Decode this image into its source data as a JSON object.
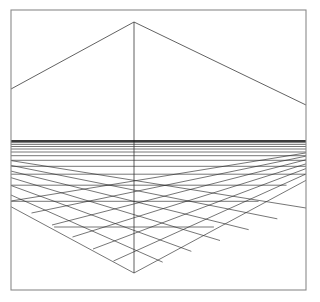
{
  "figure": {
    "canvas": {
      "width": 320,
      "height": 302,
      "background_color": "#ffffff"
    }
  },
  "frame": {
    "name": "outer-border",
    "x": 11,
    "y": 10,
    "width": 295,
    "height": 280,
    "stroke_color": "#8a8a8a",
    "stroke_width": 1.1
  },
  "geometry": {
    "apex": {
      "x": 134,
      "y": 22
    },
    "bottom_vertex": {
      "x": 134,
      "y": 273
    },
    "horizon_y": 141,
    "center_axis_x": 134,
    "left_edge_x": 11,
    "right_edge_x": 306,
    "bottom_edge_y": 290,
    "roof_left_end": {
      "x": 11,
      "y": 89
    },
    "roof_right_end": {
      "x": 306,
      "y": 105
    },
    "stroke_color": "#2b2b2b"
  },
  "chart_data": {
    "type": "line",
    "xlabel": "",
    "ylabel": "",
    "grid": true,
    "legend_position": "none",
    "xlim": [
      11,
      306
    ],
    "ylim": [
      10,
      290
    ],
    "horizon_rows_y": [
      141.0,
      142.6,
      144.4,
      146.5,
      149.0,
      152.0,
      155.7,
      160.3,
      166.3,
      174.2,
      185.2,
      201.3,
      227.0,
      273.0
    ],
    "floor_depth_rows": 13,
    "floor_columns_left": 6,
    "floor_columns_right": 6,
    "series": [
      {
        "name": "roof-diagonals",
        "points": [
          [
            11,
            89
          ],
          [
            134,
            22
          ],
          [
            306,
            105
          ]
        ]
      },
      {
        "name": "center-vertical-axis",
        "points": [
          [
            134,
            22
          ],
          [
            134,
            273
          ]
        ]
      },
      {
        "name": "horizon",
        "points": [
          [
            11,
            141
          ],
          [
            306,
            141
          ]
        ]
      }
    ]
  }
}
